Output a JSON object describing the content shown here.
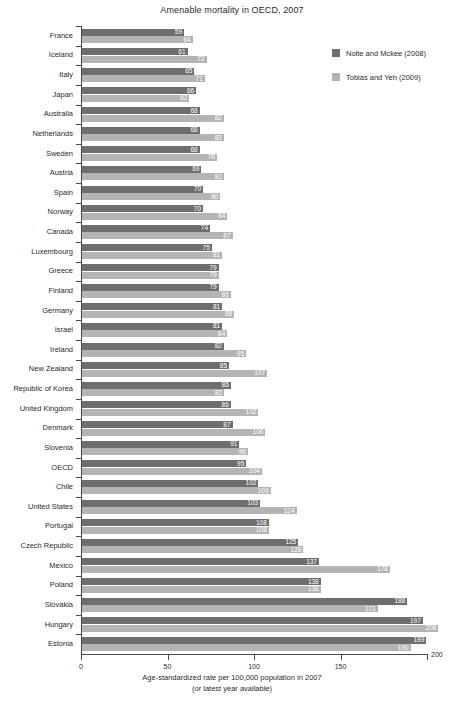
{
  "chart_data": {
    "type": "bar",
    "orientation": "horizontal",
    "title": "Amenable mortality in OECD, 2007",
    "xlabel_line1": "Age-standardized rate per 100,000 population in 2007",
    "xlabel_line2": "(or latest year available)",
    "ylabel": "",
    "xlim": [
      0,
      200
    ],
    "xticks": [
      0,
      50,
      100,
      150,
      200
    ],
    "xtick_labels": [
      "0",
      "50",
      "100",
      "150",
      "200"
    ],
    "grid": false,
    "legend_position": "top-right",
    "colors": {
      "series_0": "#6e6e6e",
      "series_1": "#b4b4b4",
      "axis": "#4a4a4a",
      "text": "#2b2b2b",
      "value_label": "#ffffff",
      "background": "#ffffff"
    },
    "categories": [
      "France",
      "Iceland",
      "Italy",
      "Japan",
      "Australia",
      "Netherlands",
      "Sweden",
      "Austria",
      "Spain",
      "Norway",
      "Canada",
      "Luxembourg",
      "Greece",
      "Finland",
      "Germany",
      "Israel",
      "Ireland",
      "New Zealand",
      "Republic of Korea",
      "United Kingdom",
      "Denmark",
      "Slovenia",
      "OECD",
      "Chile",
      "United States",
      "Portugal",
      "Czech Republic",
      "Mexico",
      "Poland",
      "Slovakia",
      "Hungary",
      "Estonia"
    ],
    "series": [
      {
        "name": "Nolte and Mckee (2008)",
        "color": "#6e6e6e",
        "values": [
          59,
          61,
          65,
          66,
          68,
          68,
          68,
          69,
          70,
          70,
          74,
          75,
          79,
          79,
          81,
          81,
          82,
          85,
          86,
          86,
          87,
          91,
          95,
          102,
          103,
          108,
          125,
          137,
          138,
          188,
          197,
          199
        ]
      },
      {
        "name": "Tobias and Yeh (2009)",
        "color": "#b4b4b4",
        "values": [
          64,
          72,
          71,
          62,
          82,
          82,
          78,
          82,
          80,
          84,
          87,
          81,
          79,
          86,
          88,
          84,
          95,
          107,
          82,
          102,
          106,
          96,
          104,
          109,
          124,
          108,
          128,
          178,
          138,
          171,
          206,
          190
        ]
      }
    ]
  }
}
